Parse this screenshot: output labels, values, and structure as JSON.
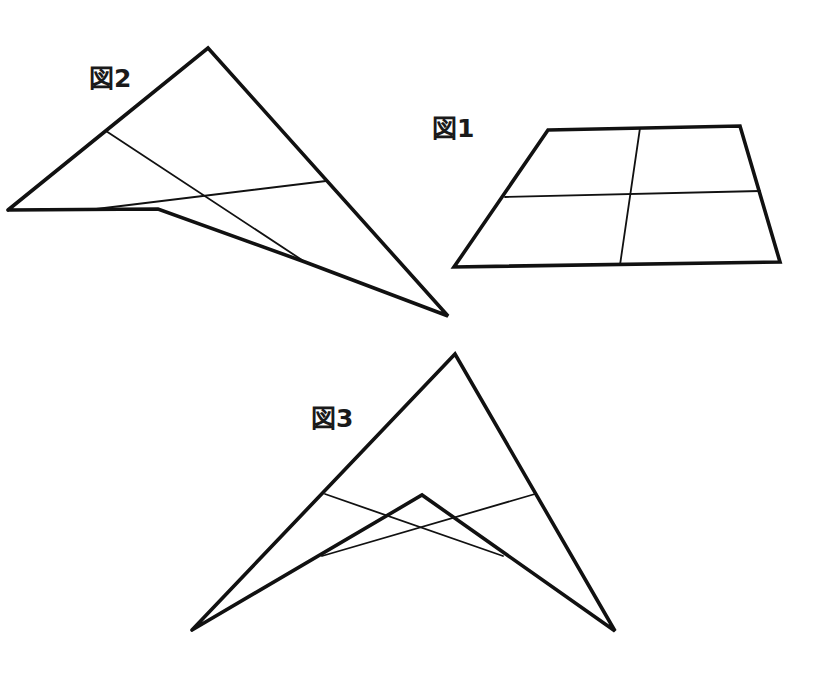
{
  "figures": {
    "fig1": {
      "label": "図1",
      "description": "Trapezoid sheet divided into four by two fold lines",
      "outline": [
        [
          548,
          130
        ],
        [
          740,
          126
        ],
        [
          780,
          262
        ],
        [
          454,
          267
        ]
      ],
      "creases": [
        [
          [
            505,
            197
          ],
          [
            760,
            191
          ]
        ],
        [
          [
            640,
            128
          ],
          [
            620,
            265
          ]
        ]
      ]
    },
    "fig2": {
      "label": "図2",
      "description": "Sheet folded once into a kite-like shape",
      "outline": [
        [
          8,
          210
        ],
        [
          208,
          48
        ],
        [
          448,
          316
        ],
        [
          305,
          262
        ],
        [
          158,
          209
        ],
        [
          8,
          210
        ]
      ],
      "creases": [
        [
          [
            106,
            131
          ],
          [
            305,
            262
          ]
        ],
        [
          [
            88,
            210
          ],
          [
            326,
            181
          ]
        ]
      ]
    },
    "fig3": {
      "label": "図3",
      "description": "Sheet folded again into an arrowhead shape",
      "outline": [
        [
          192,
          630
        ],
        [
          455,
          354
        ],
        [
          615,
          631
        ],
        [
          422,
          495
        ],
        [
          192,
          630
        ]
      ],
      "creases": [
        [
          [
            325,
            494
          ],
          [
            503,
            556
          ]
        ],
        [
          [
            535,
            494
          ],
          [
            322,
            556
          ]
        ]
      ]
    }
  },
  "colors": {
    "stroke": "#111111",
    "background": "#ffffff",
    "label": "#1a1a1a"
  }
}
